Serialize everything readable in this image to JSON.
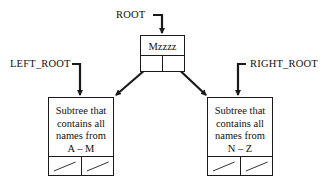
{
  "diagram": {
    "type": "binary-search-tree-structure",
    "pointers": {
      "root": "ROOT",
      "left_root": "LEFT_ROOT",
      "right_root": "RIGHT_ROOT"
    },
    "root_node": {
      "value": "Mzzzz",
      "left_child": "LEFT_ROOT subtree",
      "right_child": "RIGHT_ROOT subtree"
    },
    "left_subtree": {
      "lines": [
        "Subtree that",
        "contains all",
        "names from",
        "A – M"
      ],
      "left_pointer": "null",
      "right_pointer": "null"
    },
    "right_subtree": {
      "lines": [
        "Subtree that",
        "contains all",
        "names from",
        "N – Z"
      ],
      "left_pointer": "null",
      "right_pointer": "null"
    },
    "colors": {
      "stroke": "#1a1a1a",
      "background": "#ffffff",
      "text": "#111111"
    }
  }
}
